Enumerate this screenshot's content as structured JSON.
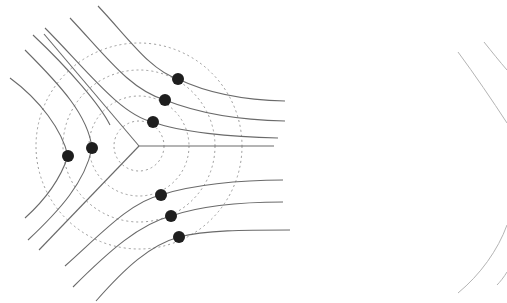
{
  "figure": {
    "colors": {
      "background": "#ffffff",
      "lines": "#6a6a6a",
      "circles": "#9a9a9a",
      "dots": "#1e1e1e",
      "faint_lines": "#b4b4b4"
    },
    "center": {
      "x": 139,
      "y": 146
    },
    "circle_radii": [
      25,
      50,
      76,
      103
    ],
    "junction": {
      "branches": [
        {
          "name": "right",
          "to": [
            282,
            146
          ]
        },
        {
          "name": "upper-left",
          "to": [
            44,
            30
          ]
        },
        {
          "name": "lower-left",
          "to": [
            38,
            252
          ]
        }
      ]
    },
    "dots": [
      {
        "x": 178,
        "y": 79
      },
      {
        "x": 165,
        "y": 100
      },
      {
        "x": 153,
        "y": 122
      },
      {
        "x": 68,
        "y": 156
      },
      {
        "x": 92,
        "y": 148
      },
      {
        "x": 161,
        "y": 195
      },
      {
        "x": 171,
        "y": 216
      },
      {
        "x": 179,
        "y": 237
      }
    ],
    "dot_radius": 6
  }
}
